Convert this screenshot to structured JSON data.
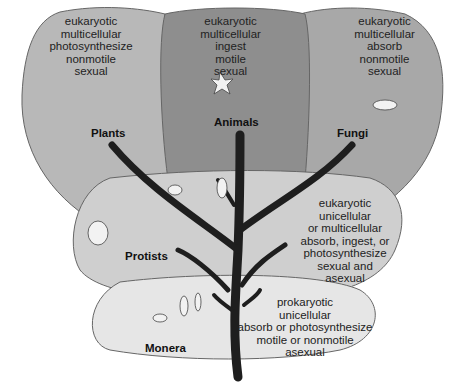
{
  "kingdoms": {
    "plants": {
      "name": "Plants",
      "traits": [
        "eukaryotic",
        "multicellular",
        "photosynthesize",
        "nonmotile",
        "sexual"
      ],
      "fill": "#b8b8b8"
    },
    "animals": {
      "name": "Animals",
      "traits": [
        "eukaryotic",
        "multicellular",
        "ingest",
        "motile",
        "sexual"
      ],
      "fill": "#8e8e8e"
    },
    "fungi": {
      "name": "Fungi",
      "traits": [
        "eukaryotic",
        "multicellular",
        "absorb",
        "nonmotile",
        "sexual"
      ],
      "fill": "#a8a8a8"
    },
    "protists": {
      "name": "Protists",
      "traits": [
        "eukaryotic",
        "unicellular",
        "or multicellular",
        "absorb, ingest, or",
        "photosynthesize",
        "sexual and",
        "asexual"
      ],
      "fill": "#cfcfcf"
    },
    "monera": {
      "name": "Monera",
      "traits": [
        "prokaryotic",
        "unicellular",
        "absorb or photosynthesize",
        "motile or nonmotile",
        "asexual"
      ],
      "fill": "#e6e6e6"
    }
  },
  "colors": {
    "trunk": "#1e1e1e",
    "outline": "#555555"
  }
}
